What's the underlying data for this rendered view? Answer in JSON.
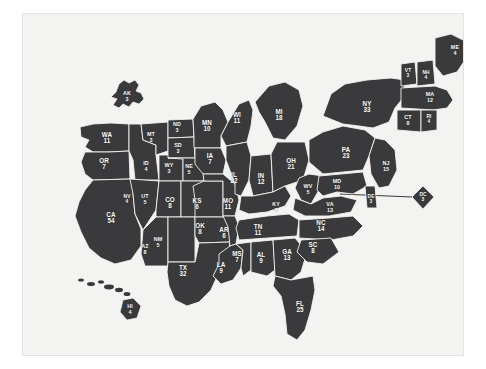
{
  "figure": {
    "name": "us-electoral-college-map",
    "background_color": "#f3f3f1",
    "land_color": "#3a3a3c",
    "border_color": "#ffffff",
    "label_color": "#ffffff",
    "page_background": "#ffffff"
  },
  "chart_data": {
    "type": "map",
    "title": "",
    "subtitle": "",
    "xlabel": "",
    "ylabel": "",
    "value_name": "Electoral Votes",
    "legend": [],
    "annotations": [
      {
        "name": "dc-leader-line",
        "text": "",
        "from": "MD coast",
        "to": "DC inset"
      }
    ],
    "total_votes": 538,
    "categories": [
      "AK",
      "WA",
      "OR",
      "MT",
      "ID",
      "WY",
      "ND",
      "SD",
      "NE",
      "MN",
      "WI",
      "MI",
      "IA",
      "IL",
      "IN",
      "OH",
      "NY",
      "VT",
      "NH",
      "ME",
      "MA",
      "CT",
      "RI",
      "PA",
      "NJ",
      "MD",
      "DE",
      "DC",
      "WV",
      "VA",
      "NC",
      "SC",
      "GA",
      "FL",
      "AL",
      "MS",
      "TN",
      "KY",
      "AR",
      "LA",
      "MO",
      "KS",
      "OK",
      "TX",
      "NM",
      "CO",
      "UT",
      "AZ",
      "NV",
      "CA",
      "HI"
    ],
    "values": [
      3,
      11,
      7,
      3,
      4,
      3,
      3,
      3,
      5,
      10,
      11,
      18,
      7,
      22,
      12,
      21,
      33,
      3,
      4,
      4,
      12,
      8,
      4,
      23,
      15,
      10,
      3,
      3,
      5,
      13,
      14,
      8,
      13,
      25,
      9,
      7,
      11,
      8,
      6,
      9,
      11,
      6,
      8,
      32,
      5,
      8,
      5,
      8,
      4,
      54,
      4
    ],
    "states": [
      {
        "abbr": "AK",
        "votes": "3",
        "x": 104,
        "y": 82,
        "size": "sm"
      },
      {
        "abbr": "WA",
        "votes": "11",
        "x": 84,
        "y": 124
      },
      {
        "abbr": "OR",
        "votes": "7",
        "x": 81,
        "y": 150
      },
      {
        "abbr": "MT",
        "votes": "3",
        "x": 128,
        "y": 123,
        "size": "sm"
      },
      {
        "abbr": "ID",
        "votes": "4",
        "x": 123,
        "y": 152,
        "size": "sm"
      },
      {
        "abbr": "WY",
        "votes": "3",
        "x": 146,
        "y": 154,
        "size": "sm"
      },
      {
        "abbr": "ND",
        "votes": "3",
        "x": 154,
        "y": 113,
        "size": "sm"
      },
      {
        "abbr": "SD",
        "votes": "3",
        "x": 155,
        "y": 134,
        "size": "sm"
      },
      {
        "abbr": "NE",
        "votes": "5",
        "x": 166,
        "y": 155,
        "size": "sm"
      },
      {
        "abbr": "MN",
        "votes": "10",
        "x": 184,
        "y": 112
      },
      {
        "abbr": "WI",
        "votes": "11",
        "x": 214,
        "y": 104
      },
      {
        "abbr": "MI",
        "votes": "18",
        "x": 256,
        "y": 101
      },
      {
        "abbr": "IA",
        "votes": "7",
        "x": 187,
        "y": 145
      },
      {
        "abbr": "IL",
        "votes": "22",
        "x": 211,
        "y": 164
      },
      {
        "abbr": "IN",
        "votes": "12",
        "x": 238,
        "y": 165
      },
      {
        "abbr": "OH",
        "votes": "21",
        "x": 268,
        "y": 150
      },
      {
        "abbr": "NY",
        "votes": "33",
        "x": 344,
        "y": 93
      },
      {
        "abbr": "VT",
        "votes": "3",
        "x": 385,
        "y": 60,
        "size": "xs"
      },
      {
        "abbr": "NH",
        "votes": "4",
        "x": 403,
        "y": 62,
        "size": "xs"
      },
      {
        "abbr": "ME",
        "votes": "4",
        "x": 432,
        "y": 36,
        "size": "sm"
      },
      {
        "abbr": "MA",
        "votes": "12",
        "x": 407,
        "y": 83,
        "size": "sm"
      },
      {
        "abbr": "CT",
        "votes": "8",
        "x": 385,
        "y": 106,
        "size": "sm"
      },
      {
        "abbr": "RI",
        "votes": "4",
        "x": 406,
        "y": 106,
        "size": "xs"
      },
      {
        "abbr": "PA",
        "votes": "23",
        "x": 323,
        "y": 139
      },
      {
        "abbr": "NJ",
        "votes": "15",
        "x": 363,
        "y": 152,
        "size": "sm"
      },
      {
        "abbr": "MD",
        "votes": "10",
        "x": 314,
        "y": 170,
        "size": "sm"
      },
      {
        "abbr": "DE",
        "votes": "3",
        "x": 348,
        "y": 186,
        "size": "xs"
      },
      {
        "abbr": "DC",
        "votes": "3",
        "x": 400,
        "y": 184,
        "size": "xs"
      },
      {
        "abbr": "WV",
        "votes": "5",
        "x": 285,
        "y": 175,
        "size": "sm"
      },
      {
        "abbr": "VA",
        "votes": "13",
        "x": 307,
        "y": 193,
        "size": "sm"
      },
      {
        "abbr": "NC",
        "votes": "14",
        "x": 298,
        "y": 212
      },
      {
        "abbr": "SC",
        "votes": "8",
        "x": 290,
        "y": 234
      },
      {
        "abbr": "GA",
        "votes": "13",
        "x": 264,
        "y": 241
      },
      {
        "abbr": "FL",
        "votes": "25",
        "x": 277,
        "y": 293
      },
      {
        "abbr": "AL",
        "votes": "9",
        "x": 238,
        "y": 244
      },
      {
        "abbr": "MS",
        "votes": "7",
        "x": 214,
        "y": 243
      },
      {
        "abbr": "TN",
        "votes": "11",
        "x": 235,
        "y": 216
      },
      {
        "abbr": "KY",
        "votes": "8",
        "x": 253,
        "y": 193,
        "size": "sm"
      },
      {
        "abbr": "AR",
        "votes": "6",
        "x": 201,
        "y": 219
      },
      {
        "abbr": "LA",
        "votes": "9",
        "x": 198,
        "y": 254
      },
      {
        "abbr": "MO",
        "votes": "11",
        "x": 205,
        "y": 190
      },
      {
        "abbr": "KS",
        "votes": "6",
        "x": 174,
        "y": 190
      },
      {
        "abbr": "OK",
        "votes": "8",
        "x": 177,
        "y": 215
      },
      {
        "abbr": "TX",
        "votes": "32",
        "x": 160,
        "y": 257
      },
      {
        "abbr": "NM",
        "votes": "5",
        "x": 135,
        "y": 228,
        "size": "sm"
      },
      {
        "abbr": "CO",
        "votes": "8",
        "x": 147,
        "y": 189
      },
      {
        "abbr": "UT",
        "votes": "5",
        "x": 122,
        "y": 185,
        "size": "sm"
      },
      {
        "abbr": "AZ",
        "votes": "8",
        "x": 122,
        "y": 235,
        "size": "sm"
      },
      {
        "abbr": "NV",
        "votes": "4",
        "x": 104,
        "y": 186,
        "size": "xs"
      },
      {
        "abbr": "CA",
        "votes": "54",
        "x": 88,
        "y": 204
      },
      {
        "abbr": "HI",
        "votes": "4",
        "x": 107,
        "y": 295,
        "size": "sm"
      }
    ]
  }
}
